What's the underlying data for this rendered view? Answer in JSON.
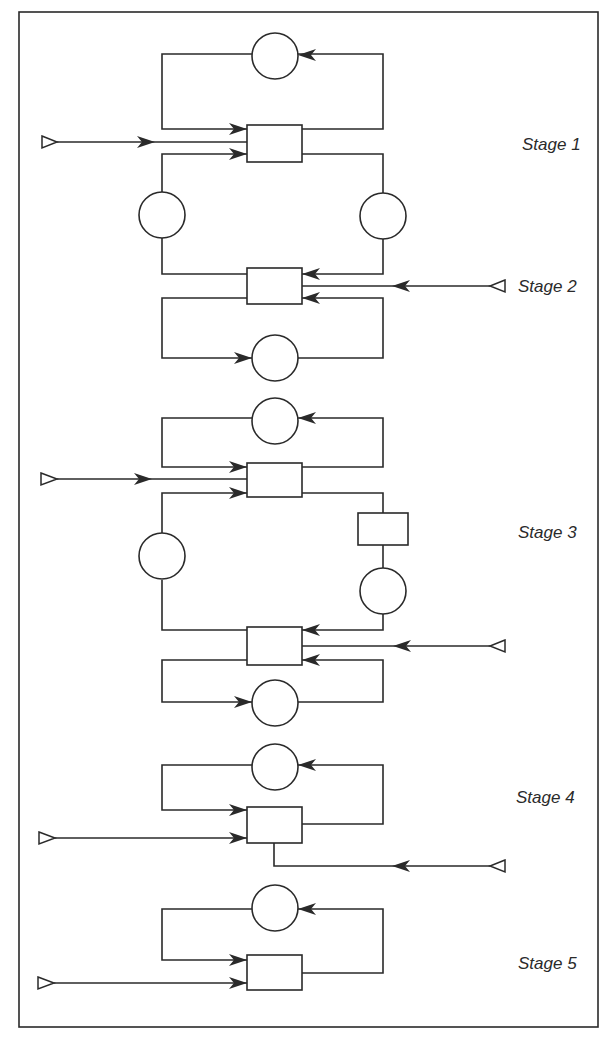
{
  "diagram": {
    "stages": [
      {
        "label": "Stage 1"
      },
      {
        "label": "Stage 2"
      },
      {
        "label": "Stage 3"
      },
      {
        "label": "Stage 4"
      },
      {
        "label": "Stage 5"
      }
    ],
    "colors": {
      "line": "#2a2a2a",
      "background": "#ffffff"
    }
  }
}
